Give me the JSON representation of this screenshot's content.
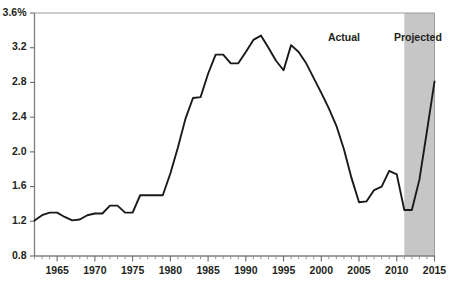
{
  "chart_data": {
    "type": "line",
    "title": "",
    "subtitle": "",
    "xlabel": "",
    "ylabel": "",
    "ylim": [
      0.8,
      3.6
    ],
    "xlim": [
      1962,
      2015
    ],
    "y_unit": "%",
    "grid": false,
    "legend_position": "none",
    "y_ticks": [
      "0.8",
      "1.2",
      "1.6",
      "2.0",
      "2.4",
      "2.8",
      "3.2",
      "3.6%"
    ],
    "y_tick_values": [
      0.8,
      1.2,
      1.6,
      2.0,
      2.4,
      2.8,
      3.2,
      3.6
    ],
    "x_ticks": [
      "1965",
      "1970",
      "1975",
      "1980",
      "1985",
      "1990",
      "1995",
      "2000",
      "2005",
      "2010",
      "2015"
    ],
    "x_tick_values": [
      1965,
      1970,
      1975,
      1980,
      1985,
      1990,
      1995,
      2000,
      2005,
      2010,
      2015
    ],
    "x_minor_tick_step": 1,
    "annotations": [
      {
        "text": "Actual",
        "x": 2003,
        "y": 3.28
      },
      {
        "text": "Projected",
        "x": 2012.8,
        "y": 3.28
      }
    ],
    "shaded_regions": [
      {
        "label": "Projected",
        "x_start": 2011,
        "x_end": 2015,
        "color": "#c6c6c6"
      }
    ],
    "series": [
      {
        "name": "Rate",
        "color": "#1a1a1a",
        "x": [
          1962,
          1963,
          1964,
          1965,
          1966,
          1967,
          1968,
          1969,
          1970,
          1971,
          1972,
          1973,
          1974,
          1975,
          1976,
          1977,
          1978,
          1979,
          1980,
          1981,
          1982,
          1983,
          1984,
          1985,
          1986,
          1987,
          1988,
          1989,
          1990,
          1991,
          1992,
          1993,
          1994,
          1995,
          1996,
          1997,
          1998,
          1999,
          2000,
          2001,
          2002,
          2003,
          2004,
          2005,
          2006,
          2007,
          2008,
          2009,
          2010,
          2011,
          2012,
          2013,
          2014,
          2015
        ],
        "values": [
          1.21,
          1.27,
          1.3,
          1.3,
          1.25,
          1.21,
          1.22,
          1.27,
          1.29,
          1.29,
          1.38,
          1.38,
          1.3,
          1.3,
          1.5,
          1.5,
          1.5,
          1.5,
          1.75,
          2.05,
          2.38,
          2.62,
          2.63,
          2.9,
          3.12,
          3.12,
          3.02,
          3.02,
          3.15,
          3.29,
          3.34,
          3.2,
          3.05,
          2.94,
          3.23,
          3.15,
          3.02,
          2.85,
          2.68,
          2.5,
          2.3,
          2.03,
          1.7,
          1.42,
          1.43,
          1.56,
          1.6,
          1.78,
          1.74,
          1.33,
          1.33,
          1.68,
          2.24,
          2.81
        ]
      }
    ]
  },
  "labels": {
    "actual": "Actual",
    "projected": "Projected"
  }
}
